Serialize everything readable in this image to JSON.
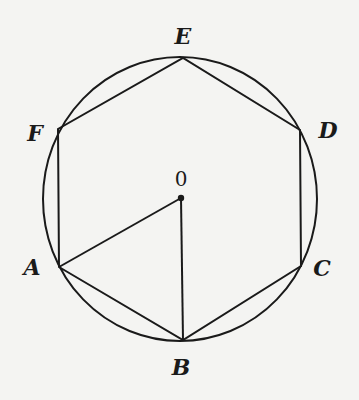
{
  "figure": {
    "type": "regular hexagon inscribed in circle",
    "colors": {
      "background": "#f4f4f2",
      "ink": "#1a1a1a"
    },
    "circle": {
      "cx": 180,
      "cy": 199,
      "rx": 137,
      "ry": 142
    },
    "center": {
      "label": "0",
      "x": 181,
      "y": 198,
      "label_x": 181,
      "label_y": 186
    },
    "vertices": [
      {
        "name": "A",
        "x": 59,
        "y": 267,
        "label_x": 32,
        "label_y": 275
      },
      {
        "name": "B",
        "x": 183,
        "y": 340,
        "label_x": 181,
        "label_y": 375
      },
      {
        "name": "C",
        "x": 301,
        "y": 266,
        "label_x": 322,
        "label_y": 276
      },
      {
        "name": "D",
        "x": 300,
        "y": 130,
        "label_x": 328,
        "label_y": 138
      },
      {
        "name": "E",
        "x": 183,
        "y": 58,
        "label_x": 183,
        "label_y": 44
      },
      {
        "name": "F",
        "x": 58,
        "y": 129,
        "label_x": 35,
        "label_y": 141
      }
    ],
    "hexagon_order": [
      "A",
      "B",
      "C",
      "D",
      "E",
      "F"
    ],
    "extra_segments": [
      {
        "from": "O",
        "to": "A"
      },
      {
        "from": "O",
        "to": "B"
      }
    ],
    "labels": {
      "A": "A",
      "B": "B",
      "C": "C",
      "D": "D",
      "E": "E",
      "F": "F",
      "O": "0"
    }
  }
}
